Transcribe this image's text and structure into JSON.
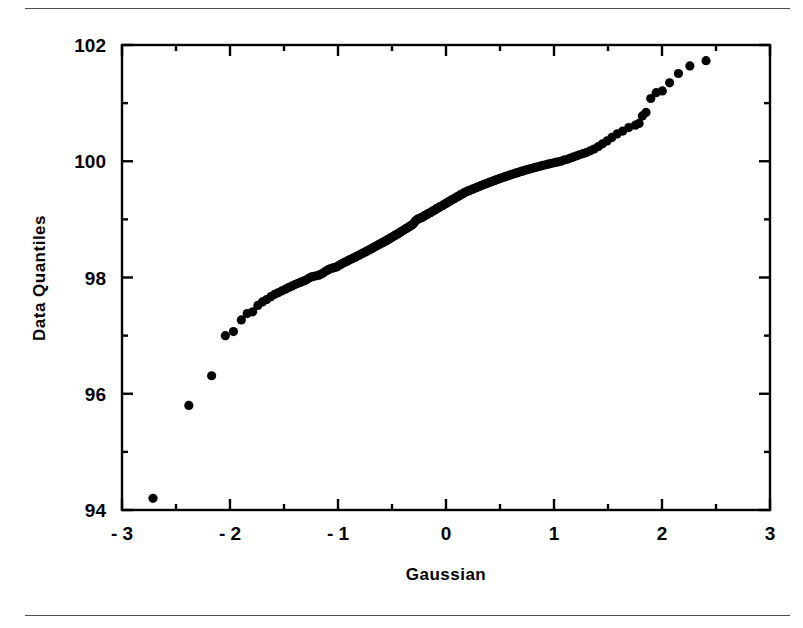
{
  "figure": {
    "has_top_rule": true,
    "has_bottom_rule": true,
    "rule_color": "#4a4a4a",
    "background": "#ffffff",
    "foreground": "#000000"
  },
  "chart_data": {
    "type": "scatter",
    "title": "",
    "xlabel": "Gaussian",
    "ylabel": "Data  Quantiles",
    "xlim": [
      -3,
      3
    ],
    "ylim": [
      94,
      102
    ],
    "grid": false,
    "legend": null,
    "frame": "box",
    "x_major_ticks": [
      -3,
      -2,
      -1,
      0,
      1,
      2,
      3
    ],
    "x_major_tick_labels": [
      "- 3",
      "- 2",
      "- 1",
      "0",
      "1",
      "2",
      "3"
    ],
    "x_minor_ticks": [
      -2.5,
      -1.5,
      -0.5,
      0.5,
      1.5,
      2.5
    ],
    "y_major_ticks": [
      94,
      96,
      98,
      100,
      102
    ],
    "y_major_tick_labels": [
      "94",
      "96",
      "98",
      "100",
      "102"
    ],
    "y_minor_ticks": [
      95,
      97,
      99,
      101
    ],
    "marker": "circle",
    "marker_size": 4.6,
    "marker_color": "#000000",
    "n_points": 166,
    "points": [
      [
        -2.713,
        94.2
      ],
      [
        -2.381,
        95.8
      ],
      [
        -2.17,
        96.31
      ],
      [
        -2.043,
        97.0
      ],
      [
        -1.968,
        97.07
      ],
      [
        -1.895,
        97.27
      ],
      [
        -1.841,
        97.38
      ],
      [
        -1.79,
        97.41
      ],
      [
        -1.742,
        97.52
      ],
      [
        -1.7,
        97.58
      ],
      [
        -1.66,
        97.62
      ],
      [
        -1.622,
        97.67
      ],
      [
        -1.586,
        97.71
      ],
      [
        -1.551,
        97.74
      ],
      [
        -1.518,
        97.77
      ],
      [
        -1.486,
        97.8
      ],
      [
        -1.456,
        97.83
      ],
      [
        -1.427,
        97.85
      ],
      [
        -1.398,
        97.88
      ],
      [
        -1.371,
        97.9
      ],
      [
        -1.344,
        97.92
      ],
      [
        -1.318,
        97.94
      ],
      [
        -1.293,
        97.96
      ],
      [
        -1.269,
        97.99
      ],
      [
        -1.245,
        98.01
      ],
      [
        -1.222,
        98.02
      ],
      [
        -1.199,
        98.03
      ],
      [
        -1.177,
        98.04
      ],
      [
        -1.155,
        98.06
      ],
      [
        -1.134,
        98.08
      ],
      [
        -1.113,
        98.11
      ],
      [
        -1.093,
        98.13
      ],
      [
        -1.073,
        98.15
      ],
      [
        -1.053,
        98.16
      ],
      [
        -1.034,
        98.17
      ],
      [
        -1.015,
        98.18
      ],
      [
        -0.996,
        98.2
      ],
      [
        -0.978,
        98.22
      ],
      [
        -0.96,
        98.24
      ],
      [
        -0.942,
        98.26
      ],
      [
        -0.924,
        98.27
      ],
      [
        -0.907,
        98.29
      ],
      [
        -0.89,
        98.31
      ],
      [
        -0.873,
        98.32
      ],
      [
        -0.856,
        98.34
      ],
      [
        -0.84,
        98.35
      ],
      [
        -0.823,
        98.37
      ],
      [
        -0.807,
        98.38
      ],
      [
        -0.791,
        98.4
      ],
      [
        -0.776,
        98.41
      ],
      [
        -0.76,
        98.43
      ],
      [
        -0.745,
        98.44
      ],
      [
        -0.729,
        98.46
      ],
      [
        -0.714,
        98.47
      ],
      [
        -0.699,
        98.49
      ],
      [
        -0.684,
        98.5
      ],
      [
        -0.67,
        98.52
      ],
      [
        -0.655,
        98.53
      ],
      [
        -0.64,
        98.55
      ],
      [
        -0.626,
        98.56
      ],
      [
        -0.612,
        98.58
      ],
      [
        -0.598,
        98.59
      ],
      [
        -0.584,
        98.6
      ],
      [
        -0.57,
        98.62
      ],
      [
        -0.556,
        98.63
      ],
      [
        -0.542,
        98.65
      ],
      [
        -0.528,
        98.66
      ],
      [
        -0.514,
        98.68
      ],
      [
        -0.501,
        98.69
      ],
      [
        -0.487,
        98.71
      ],
      [
        -0.474,
        98.72
      ],
      [
        -0.461,
        98.74
      ],
      [
        -0.447,
        98.75
      ],
      [
        -0.434,
        98.77
      ],
      [
        -0.421,
        98.78
      ],
      [
        -0.408,
        98.8
      ],
      [
        -0.395,
        98.81
      ],
      [
        -0.382,
        98.83
      ],
      [
        -0.369,
        98.84
      ],
      [
        -0.356,
        98.86
      ],
      [
        -0.343,
        98.87
      ],
      [
        -0.33,
        98.89
      ],
      [
        -0.317,
        98.9
      ],
      [
        -0.304,
        98.92
      ],
      [
        -0.292,
        98.95
      ],
      [
        -0.279,
        98.98
      ],
      [
        -0.266,
        99.0
      ],
      [
        -0.254,
        99.01
      ],
      [
        -0.241,
        99.02
      ],
      [
        -0.228,
        99.03
      ],
      [
        -0.216,
        99.04
      ],
      [
        -0.203,
        99.06
      ],
      [
        -0.191,
        99.07
      ],
      [
        -0.178,
        99.08
      ],
      [
        -0.166,
        99.1
      ],
      [
        -0.153,
        99.11
      ],
      [
        -0.141,
        99.12
      ],
      [
        -0.128,
        99.14
      ],
      [
        -0.116,
        99.15
      ],
      [
        -0.104,
        99.16
      ],
      [
        -0.091,
        99.18
      ],
      [
        -0.079,
        99.19
      ],
      [
        -0.067,
        99.2
      ],
      [
        -0.054,
        99.22
      ],
      [
        -0.042,
        99.23
      ],
      [
        -0.03,
        99.24
      ],
      [
        -0.017,
        99.26
      ],
      [
        -0.005,
        99.27
      ],
      [
        0.007,
        99.28
      ],
      [
        0.02,
        99.3
      ],
      [
        0.032,
        99.31
      ],
      [
        0.044,
        99.32
      ],
      [
        0.057,
        99.34
      ],
      [
        0.069,
        99.35
      ],
      [
        0.081,
        99.36
      ],
      [
        0.094,
        99.38
      ],
      [
        0.106,
        99.39
      ],
      [
        0.119,
        99.4
      ],
      [
        0.131,
        99.42
      ],
      [
        0.144,
        99.43
      ],
      [
        0.156,
        99.44
      ],
      [
        0.169,
        99.46
      ],
      [
        0.182,
        99.47
      ],
      [
        0.194,
        99.48
      ],
      [
        0.207,
        99.49
      ],
      [
        0.22,
        99.5
      ],
      [
        0.233,
        99.51
      ],
      [
        0.246,
        99.52
      ],
      [
        0.259,
        99.53
      ],
      [
        0.272,
        99.54
      ],
      [
        0.285,
        99.55
      ],
      [
        0.298,
        99.56
      ],
      [
        0.311,
        99.57
      ],
      [
        0.325,
        99.58
      ],
      [
        0.338,
        99.59
      ],
      [
        0.352,
        99.6
      ],
      [
        0.366,
        99.61
      ],
      [
        0.38,
        99.62
      ],
      [
        0.394,
        99.63
      ],
      [
        0.408,
        99.64
      ],
      [
        0.422,
        99.65
      ],
      [
        0.436,
        99.66
      ],
      [
        0.451,
        99.67
      ],
      [
        0.465,
        99.68
      ],
      [
        0.48,
        99.69
      ],
      [
        0.495,
        99.7
      ],
      [
        0.51,
        99.71
      ],
      [
        0.525,
        99.72
      ],
      [
        0.541,
        99.73
      ],
      [
        0.556,
        99.74
      ],
      [
        0.572,
        99.75
      ],
      [
        0.588,
        99.76
      ],
      [
        0.604,
        99.77
      ],
      [
        0.621,
        99.78
      ],
      [
        0.637,
        99.79
      ],
      [
        0.654,
        99.8
      ],
      [
        0.671,
        99.81
      ],
      [
        0.689,
        99.82
      ],
      [
        0.706,
        99.83
      ],
      [
        0.724,
        99.84
      ],
      [
        0.742,
        99.85
      ],
      [
        0.761,
        99.86
      ],
      [
        0.78,
        99.87
      ],
      [
        0.799,
        99.88
      ],
      [
        0.819,
        99.89
      ],
      [
        0.839,
        99.9
      ],
      [
        0.859,
        99.91
      ],
      [
        0.88,
        99.92
      ],
      [
        0.901,
        99.93
      ],
      [
        0.923,
        99.94
      ],
      [
        0.945,
        99.95
      ],
      [
        0.968,
        99.96
      ],
      [
        0.991,
        99.97
      ],
      [
        1.015,
        99.98
      ],
      [
        1.04,
        99.99
      ],
      [
        1.065,
        100.0
      ],
      [
        1.091,
        100.02
      ],
      [
        1.118,
        100.03
      ],
      [
        1.146,
        100.05
      ],
      [
        1.175,
        100.07
      ],
      [
        1.204,
        100.09
      ],
      [
        1.235,
        100.11
      ],
      [
        1.267,
        100.13
      ],
      [
        1.3,
        100.15
      ],
      [
        1.335,
        100.18
      ],
      [
        1.371,
        100.21
      ],
      [
        1.409,
        100.25
      ],
      [
        1.449,
        100.3
      ],
      [
        1.491,
        100.35
      ],
      [
        1.536,
        100.41
      ],
      [
        1.584,
        100.47
      ],
      [
        1.636,
        100.52
      ],
      [
        1.692,
        100.58
      ],
      [
        1.753,
        100.62
      ],
      [
        1.788,
        100.65
      ],
      [
        1.818,
        100.78
      ],
      [
        1.852,
        100.84
      ],
      [
        1.896,
        101.08
      ],
      [
        1.946,
        101.18
      ],
      [
        2.003,
        101.21
      ],
      [
        2.07,
        101.35
      ],
      [
        2.152,
        101.51
      ],
      [
        2.258,
        101.64
      ],
      [
        2.408,
        101.73
      ]
    ]
  }
}
